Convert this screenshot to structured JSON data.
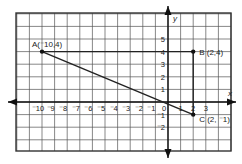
{
  "diagram": {
    "type": "coordinate-plane",
    "x_axis_label": "x",
    "y_axis_label": "y",
    "x_ticks": [
      {
        "v": -10,
        "t": "⁻10"
      },
      {
        "v": -9,
        "t": "⁻9"
      },
      {
        "v": -8,
        "t": "⁻8"
      },
      {
        "v": -7,
        "t": "⁻7"
      },
      {
        "v": -6,
        "t": "⁻6"
      },
      {
        "v": -5,
        "t": "⁻5"
      },
      {
        "v": -4,
        "t": "⁻4"
      },
      {
        "v": -3,
        "t": "⁻3"
      },
      {
        "v": -2,
        "t": "⁻2"
      },
      {
        "v": -1,
        "t": "⁻1"
      },
      {
        "v": 0,
        "t": "0"
      },
      {
        "v": 1,
        "t": "1"
      },
      {
        "v": 2,
        "t": "2"
      },
      {
        "v": 3,
        "t": "3"
      }
    ],
    "y_ticks": [
      {
        "v": 5,
        "t": "5"
      },
      {
        "v": 4,
        "t": "4"
      },
      {
        "v": 3,
        "t": "3"
      },
      {
        "v": 2,
        "t": "2"
      },
      {
        "v": 1,
        "t": "1"
      },
      {
        "v": -1,
        "t": "⁻1"
      },
      {
        "v": -2,
        "t": "⁻2"
      }
    ],
    "points": [
      {
        "name": "A",
        "label": "A(⁻10,4)",
        "x": -10,
        "y": 4
      },
      {
        "name": "B",
        "label": "B (2,4)",
        "x": 2,
        "y": 4
      },
      {
        "name": "C",
        "label": "C (2, ⁻1)",
        "x": 2,
        "y": -1
      }
    ],
    "segments": [
      [
        "A",
        "B"
      ],
      [
        "B",
        "C"
      ],
      [
        "A",
        "C"
      ]
    ],
    "grid": {
      "x_min": -11,
      "x_max": 4,
      "y_min": -4,
      "y_max": 7
    },
    "colors": {
      "grid": "#555555",
      "axis": "#111111",
      "line": "#222222"
    }
  }
}
